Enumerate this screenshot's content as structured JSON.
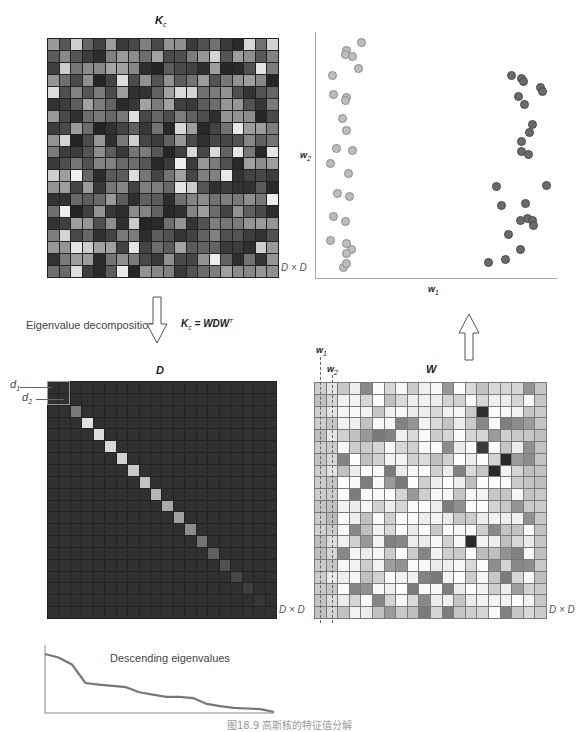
{
  "figure": {
    "caption": "图18.9  高斯核的特征值分解"
  },
  "kc": {
    "title": "K",
    "title_sub": "c",
    "size_label": "D × D",
    "rows": 20,
    "cols": 20,
    "seed": 17
  },
  "scatter": {
    "y_label": "w",
    "y_label_sub": "2",
    "x_label": "w",
    "x_label_sub": "1",
    "cluster_left": [
      [
        361,
        42
      ],
      [
        346,
        50
      ],
      [
        345,
        54
      ],
      [
        352,
        56
      ],
      [
        358,
        68
      ],
      [
        332,
        75
      ],
      [
        333,
        94
      ],
      [
        346,
        97
      ],
      [
        345,
        100
      ],
      [
        342,
        118
      ],
      [
        346,
        130
      ],
      [
        336,
        148
      ],
      [
        352,
        150
      ],
      [
        330,
        163
      ],
      [
        348,
        173
      ],
      [
        337,
        193
      ],
      [
        349,
        196
      ],
      [
        333,
        216
      ],
      [
        345,
        221
      ],
      [
        330,
        240
      ],
      [
        346,
        243
      ],
      [
        351,
        249
      ],
      [
        346,
        253
      ],
      [
        343,
        267
      ],
      [
        346,
        263
      ]
    ],
    "cluster_right": [
      [
        511,
        75
      ],
      [
        521,
        78
      ],
      [
        523,
        81
      ],
      [
        540,
        87
      ],
      [
        542,
        91
      ],
      [
        518,
        96
      ],
      [
        524,
        104
      ],
      [
        532,
        124
      ],
      [
        529,
        132
      ],
      [
        521,
        141
      ],
      [
        521,
        151
      ],
      [
        528,
        154
      ],
      [
        496,
        186
      ],
      [
        546,
        185
      ],
      [
        525,
        203
      ],
      [
        501,
        205
      ],
      [
        527,
        218
      ],
      [
        520,
        220
      ],
      [
        532,
        220
      ],
      [
        533,
        225
      ],
      [
        508,
        234
      ],
      [
        520,
        249
      ],
      [
        505,
        259
      ],
      [
        488,
        262
      ]
    ]
  },
  "decomposition": {
    "label": "Eigenvalue decomposition",
    "equation_lhs": "K",
    "equation_lhs_sub": "c",
    "equation_rhs": " = WDW",
    "equation_sup": "T"
  },
  "d_matrix": {
    "title": "D",
    "size_label": "D × D",
    "d1_label": "d",
    "d1_sub": "1",
    "d2_label": "d",
    "d2_sub": "2",
    "rows": 20,
    "cols": 20,
    "base_color": "#303030",
    "diagonal": [
      48,
      48,
      120,
      225,
      220,
      215,
      210,
      200,
      195,
      180,
      170,
      160,
      140,
      115,
      95,
      80,
      70,
      62,
      55,
      48
    ]
  },
  "w_matrix": {
    "title": "W",
    "size_label": "D × D",
    "col1_label": "w",
    "col1_sub": "1",
    "col2_label": "w",
    "col2_sub": "2",
    "rows": 20,
    "cols": 20,
    "seed": 5
  },
  "eigen_chart": {
    "title": "Descending eigenvalues",
    "type": "line",
    "values": [
      100,
      94,
      82,
      50,
      47,
      45,
      43,
      34,
      30,
      26,
      26,
      24,
      14,
      10,
      7,
      6,
      5,
      0
    ]
  },
  "chart_data": {
    "type": "line",
    "title": "Descending eigenvalues",
    "xlabel": "",
    "ylabel": "",
    "x": [
      1,
      2,
      3,
      4,
      5,
      6,
      7,
      8,
      9,
      10,
      11,
      12,
      13,
      14,
      15,
      16,
      17,
      18
    ],
    "values": [
      100,
      94,
      82,
      50,
      47,
      45,
      43,
      34,
      30,
      26,
      26,
      24,
      14,
      10,
      7,
      6,
      5,
      0
    ],
    "grid": false
  }
}
